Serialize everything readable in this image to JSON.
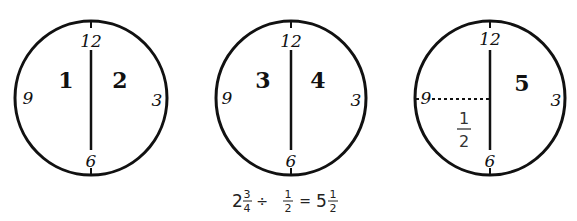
{
  "clocks": [
    {
      "id": "clock-1",
      "labels": {
        "top": "12",
        "right": "3",
        "bottom": "6",
        "left": "9"
      },
      "left_half": "1",
      "right_half": "2"
    },
    {
      "id": "clock-2",
      "labels": {
        "top": "12",
        "right": "3",
        "bottom": "6",
        "left": "9"
      },
      "left_half": "3",
      "right_half": "4"
    },
    {
      "id": "clock-3",
      "labels": {
        "top": "12",
        "right": "3",
        "bottom": "6",
        "left": "9"
      },
      "right_half": "5",
      "quarter_fraction": {
        "numerator": "1",
        "denominator": "2"
      }
    }
  ],
  "equation": {
    "whole1": "2",
    "num1": "3",
    "den1": "4",
    "op": "÷",
    "num2": "1",
    "den2": "2",
    "equals": "=",
    "whole3": "5",
    "num3": "1",
    "den3": "2"
  }
}
